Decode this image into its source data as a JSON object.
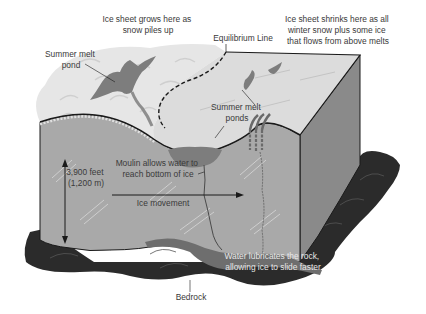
{
  "diagram": {
    "colors": {
      "background": "#ffffff",
      "snow_top": "#e6e6e6",
      "snow_swirl": "#cfcfcf",
      "ablation_top": "#dcdcdc",
      "ice_front": "#a9a9a9",
      "ice_side": "#8a8a8a",
      "melt_pond": "#7d7d7d",
      "bedrock": "#2b2b2b",
      "water_layer": "#6e6e6e",
      "outline": "#1a1a1a",
      "label_text": "#3a3a3a"
    },
    "labels": {
      "accumulation": {
        "line1": "Ice sheet grows here as",
        "line2": "snow piles up"
      },
      "ablation": {
        "line1": "Ice sheet shrinks here as all",
        "line2": "winter snow plus some ice",
        "line3": "that flows from above melts"
      },
      "equilibrium_line": "Equilibrium Line",
      "summer_melt_pond": {
        "line1": "Summer melt",
        "line2": "pond"
      },
      "summer_melt_ponds": {
        "line1": "Summer melt",
        "line2": "ponds"
      },
      "moulin": {
        "line1": "Moulin allows water to",
        "line2": "reach bottom of ice"
      },
      "thickness": {
        "line1": "3,900 feet",
        "line2": "(1,200 m)"
      },
      "ice_movement": "Ice movement",
      "water_lubrication": {
        "line1": "Water lubricates the rock,",
        "line2": "allowing ice to slide faster"
      },
      "bedrock": "Bedrock"
    }
  }
}
